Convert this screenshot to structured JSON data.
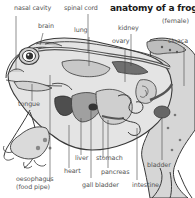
{
  "diagram": {
    "title": "anatomy of a frog",
    "subtitle": "(female)",
    "palette": {
      "outline": "#3a3a3a",
      "dark_organ": "#555555",
      "mid_organ": "#8c8c8c",
      "light_organ": "#c9c9c9",
      "body_fill": "#e2e2e2",
      "label_text": "#555555",
      "leader_line": "#444444"
    },
    "labels": {
      "nasal_cavity": "nasal cavity",
      "brain": "brain",
      "spinal_cord": "spinal cord",
      "lung": "lung",
      "kidney": "kidney",
      "ovary": "ovary",
      "cloaca": "cloaca",
      "tongue": "tongue",
      "liver": "liver",
      "heart": "heart",
      "oesophagus_line1": "oesophagus",
      "oesophagus_line2": "(food pipe)",
      "stomach": "stomach",
      "pancreas": "pancreas",
      "gall_bladder": "gall bladder",
      "intestine": "intestine",
      "bladder": "bladder"
    }
  }
}
